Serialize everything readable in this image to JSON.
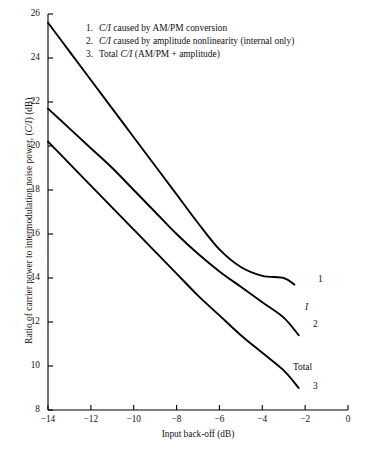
{
  "chart_data": {
    "type": "line",
    "title": "",
    "xlabel": "Input back-off (dB)",
    "ylabel": "Ratio of carrier power to intermodulation noise power, (C/I) (dB)",
    "xlim": [
      -14,
      0
    ],
    "ylim": [
      8,
      26
    ],
    "xticks": [
      -14,
      -12,
      -10,
      -8,
      -6,
      -4,
      -2,
      0
    ],
    "xtick_labels": [
      "−14",
      "−12",
      "−10",
      "−8",
      "−6",
      "−4",
      "−2",
      "0"
    ],
    "yticks": [
      8,
      10,
      12,
      14,
      16,
      18,
      20,
      22,
      24,
      26
    ],
    "ytick_labels": [
      "8",
      "10",
      "12",
      "14",
      "16",
      "18",
      "20",
      "22",
      "24",
      "26"
    ],
    "grid": false,
    "legend_position": "upper-right-inside",
    "series": [
      {
        "name": "1",
        "label": "C/I caused by AM/PM conversion",
        "end_label": "1",
        "color": "#000000",
        "x": [
          -14,
          -13,
          -12,
          -11,
          -10,
          -9,
          -8,
          -7,
          -6,
          -5,
          -4,
          -3,
          -2.5
        ],
        "y": [
          25.6,
          24.3,
          23.0,
          21.7,
          20.4,
          19.1,
          17.8,
          16.5,
          15.3,
          14.5,
          14.1,
          14.0,
          13.7
        ]
      },
      {
        "name": "2",
        "label": "C/I caused by amplitude nonlinearity (internal only)",
        "end_label": "2",
        "extra_label": "I",
        "color": "#000000",
        "x": [
          -14,
          -13,
          -12,
          -11,
          -10,
          -9,
          -8,
          -7,
          -6,
          -5,
          -4,
          -3,
          -2.3
        ],
        "y": [
          21.7,
          20.8,
          19.9,
          19.0,
          18.0,
          17.0,
          16.0,
          15.1,
          14.3,
          13.6,
          12.9,
          12.2,
          11.4
        ]
      },
      {
        "name": "3",
        "label": "Total C/I (AM/PM + amplitude)",
        "end_label": "3",
        "extra_label": "Total",
        "color": "#000000",
        "x": [
          -14,
          -13,
          -12,
          -11,
          -10,
          -9,
          -8,
          -7,
          -6,
          -5,
          -4,
          -3,
          -2.3
        ],
        "y": [
          20.2,
          19.2,
          18.2,
          17.2,
          16.2,
          15.2,
          14.2,
          13.2,
          12.3,
          11.4,
          10.6,
          9.8,
          9.0
        ]
      }
    ]
  },
  "legend": {
    "items": [
      {
        "num": "1.",
        "pre": "",
        "italic": "C/I",
        "post": " caused by AM/PM conversion"
      },
      {
        "num": "2.",
        "pre": "",
        "italic": "C/I",
        "post": " caused by amplitude nonlinearity (internal only)"
      },
      {
        "num": "3.",
        "pre": "Total ",
        "italic": "C/I",
        "post": " (AM/PM + amplitude)"
      }
    ]
  },
  "axes": {
    "x_title": "Input back-off (dB)",
    "y_title_pre": "Ratio of carrier power to intermodulation noise power, (",
    "y_title_italic": "C/I",
    "y_title_post": ") (dB)"
  },
  "annotations": {
    "curve1_end": "1",
    "curve2_end": "2",
    "curve2_mid": "I",
    "curve3_end": "3",
    "curve3_mid": "Total"
  },
  "colors": {
    "ink": "#000000",
    "background": "#ffffff"
  }
}
